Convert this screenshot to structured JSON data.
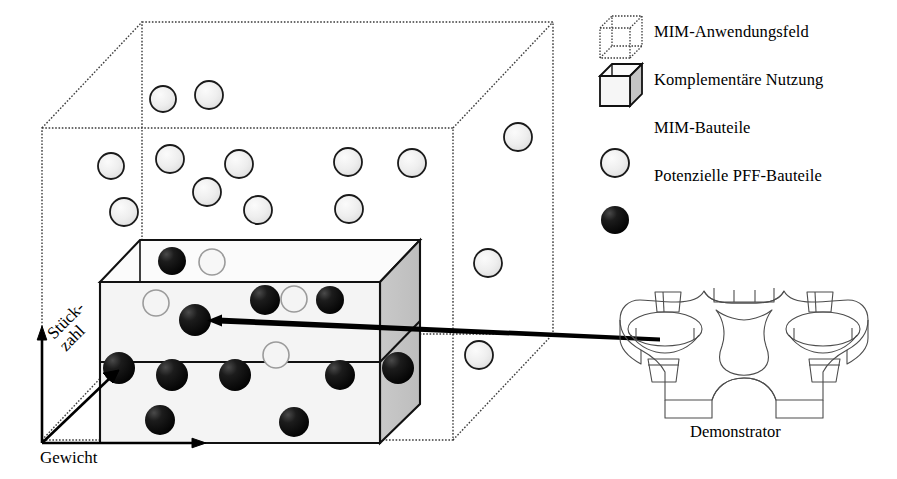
{
  "figure": {
    "type": "diagram"
  },
  "axes": {
    "vertical": "Komplexität",
    "horizontal": "Gewicht",
    "diagonal_line1": "Stück-",
    "diagonal_line2": "zahl",
    "origin": {
      "x": 42,
      "y": 443
    }
  },
  "legend": {
    "items": [
      {
        "marker": "dotted-cube-icon",
        "label": "MIM-Anwendungsfeld"
      },
      {
        "marker": "solid-cube-icon",
        "label": "Komplementäre Nutzung"
      },
      {
        "marker": "light-sphere-icon",
        "label": "MIM-Bauteile"
      },
      {
        "marker": "dark-sphere-icon",
        "label": "Potenzielle PFF-Bauteile"
      }
    ]
  },
  "demonstrator": {
    "caption": "Demonstrator"
  },
  "colors": {
    "outline": "#1a1a1a",
    "dotted": "#3a3a3a",
    "sphere_light_fill": "#ececec",
    "sphere_dark_fill": "#0d0d0d",
    "cube_gray_face": "#c4c4c4",
    "cube_front_face": "#f2f2f2",
    "background": "#ffffff"
  },
  "outer_cube": {
    "name": "MIM-Anwendungsfeld",
    "style": "dotted",
    "front_face": [
      [
        42,
        128
      ],
      [
        453,
        128
      ],
      [
        453,
        440
      ],
      [
        42,
        440
      ]
    ],
    "depth_offset": {
      "dx": 100,
      "dy": -106
    }
  },
  "inner_cube": {
    "name": "Komplementäre Nutzung",
    "style": "solid",
    "front_face": [
      [
        100,
        282
      ],
      [
        380,
        282
      ],
      [
        380,
        443
      ],
      [
        100,
        443
      ]
    ],
    "depth_offset": {
      "dx": 40,
      "dy": -42
    },
    "divider_y": 362
  },
  "mim_spheres_outside": [
    {
      "x": 163,
      "y": 99,
      "r": 13
    },
    {
      "x": 209,
      "y": 95,
      "r": 14
    },
    {
      "x": 111,
      "y": 166,
      "r": 13
    },
    {
      "x": 170,
      "y": 159,
      "r": 14
    },
    {
      "x": 239,
      "y": 164,
      "r": 14
    },
    {
      "x": 348,
      "y": 162,
      "r": 14
    },
    {
      "x": 412,
      "y": 163,
      "r": 14
    },
    {
      "x": 518,
      "y": 137,
      "r": 14
    },
    {
      "x": 207,
      "y": 192,
      "r": 14
    },
    {
      "x": 124,
      "y": 212,
      "r": 14
    },
    {
      "x": 258,
      "y": 210,
      "r": 14
    },
    {
      "x": 349,
      "y": 209,
      "r": 14
    },
    {
      "x": 488,
      "y": 263,
      "r": 14
    },
    {
      "x": 479,
      "y": 355,
      "r": 14
    }
  ],
  "mim_spheres_inside": [
    {
      "x": 212,
      "y": 262,
      "r": 13
    },
    {
      "x": 156,
      "y": 303,
      "r": 13
    },
    {
      "x": 294,
      "y": 299,
      "r": 13
    },
    {
      "x": 276,
      "y": 355,
      "r": 13
    }
  ],
  "pff_spheres": [
    {
      "x": 172,
      "y": 261,
      "r": 14
    },
    {
      "x": 265,
      "y": 300,
      "r": 15
    },
    {
      "x": 330,
      "y": 300,
      "r": 14
    },
    {
      "x": 195,
      "y": 320,
      "r": 16
    },
    {
      "x": 119,
      "y": 368,
      "r": 16
    },
    {
      "x": 172,
      "y": 375,
      "r": 16
    },
    {
      "x": 235,
      "y": 375,
      "r": 16
    },
    {
      "x": 340,
      "y": 375,
      "r": 15
    },
    {
      "x": 398,
      "y": 368,
      "r": 16
    },
    {
      "x": 160,
      "y": 420,
      "r": 15
    },
    {
      "x": 294,
      "y": 422,
      "r": 15
    }
  ],
  "callout_arrow": {
    "from": {
      "x": 660,
      "y": 340
    },
    "to": {
      "x": 212,
      "y": 320
    },
    "head": "left-arrow"
  }
}
